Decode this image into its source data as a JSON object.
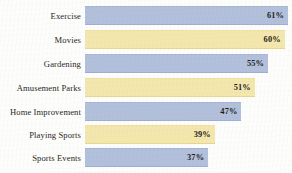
{
  "chart_data": {
    "type": "bar",
    "orientation": "horizontal",
    "title": "",
    "subtitle": "",
    "xlabel": "",
    "ylabel": "",
    "xlim": [
      0,
      61
    ],
    "grid": false,
    "legend": "none",
    "value_labels_inside_bars": true,
    "value_suffix": "%",
    "categories": [
      "Exercise",
      "Movies",
      "Gardening",
      "Amusement Parks",
      "Home Improvement",
      "Playing Sports",
      "Sports Events"
    ],
    "values": [
      61,
      60,
      55,
      51,
      47,
      39,
      37
    ],
    "value_labels": [
      "61%",
      "60%",
      "55%",
      "51%",
      "47%",
      "39%",
      "37%"
    ],
    "bar_colors": [
      "#b3c0dc",
      "#f4e7ae",
      "#b3c0dc",
      "#f4e7ae",
      "#b3c0dc",
      "#f4e7ae",
      "#b3c0dc"
    ],
    "palette": {
      "blue": "#b3c0dc",
      "yellow": "#f4e7ae",
      "background": "#fdfdfb",
      "text": "#231f20"
    },
    "bars": [
      {
        "label": "Exercise",
        "value": 61,
        "display": "61%",
        "color_name": "blue"
      },
      {
        "label": "Movies",
        "value": 60,
        "display": "60%",
        "color_name": "yellow"
      },
      {
        "label": "Gardening",
        "value": 55,
        "display": "55%",
        "color_name": "blue"
      },
      {
        "label": "Amusement Parks",
        "value": 51,
        "display": "51%",
        "color_name": "yellow"
      },
      {
        "label": "Home Improvement",
        "value": 47,
        "display": "47%",
        "color_name": "blue"
      },
      {
        "label": "Playing Sports",
        "value": 39,
        "display": "39%",
        "color_name": "yellow"
      },
      {
        "label": "Sports Events",
        "value": 37,
        "display": "37%",
        "color_name": "blue"
      }
    ]
  }
}
